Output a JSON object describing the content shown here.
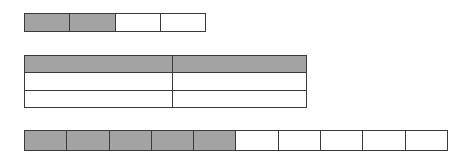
{
  "diagram": {
    "colors": {
      "fill": "#a3a3a3",
      "empty": "#ffffff",
      "border": "#3a3a3a"
    },
    "shapes": [
      {
        "id": "bar-top",
        "type": "bar",
        "parts": 4,
        "shaded": 2,
        "cells": [
          true,
          true,
          false,
          false
        ]
      },
      {
        "id": "table-mid",
        "type": "grid",
        "rows": 3,
        "columns": 2,
        "shaded_rows": [
          0
        ],
        "cells": [
          [
            true,
            true
          ],
          [
            false,
            false
          ],
          [
            false,
            false
          ]
        ]
      },
      {
        "id": "bar-bottom",
        "type": "bar",
        "parts": 10,
        "shaded": 5,
        "cells": [
          true,
          true,
          true,
          true,
          true,
          false,
          false,
          false,
          false,
          false
        ]
      }
    ]
  }
}
